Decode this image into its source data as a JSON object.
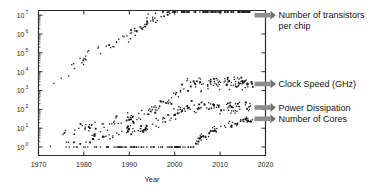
{
  "chart_data": {
    "type": "scatter",
    "title": "",
    "xlabel": "Year",
    "ylabel": "",
    "xlim": [
      1970,
      2020
    ],
    "ylim_log10": [
      0,
      7
    ],
    "yscale": "log",
    "grid": false,
    "legend_position": "right-inline-annotations",
    "xticks": [
      "1970",
      "1980",
      "1990",
      "2000",
      "2010",
      "2020"
    ],
    "xtick_values": [
      1970,
      1980,
      1990,
      2000,
      2010,
      2020
    ],
    "yticks": [
      "10^0",
      "10^1",
      "10^2",
      "10^3",
      "10^4",
      "10^5",
      "10^6",
      "10^7"
    ],
    "ytick_exponents": [
      0,
      1,
      2,
      3,
      4,
      5,
      6,
      7
    ],
    "annotations": [
      {
        "id": "transistors",
        "label_line1": "Number of transistors",
        "label_line2": "per chip",
        "y_log10": 7.0
      },
      {
        "id": "clock-speed",
        "label_line1": "Clock Speed (GHz)",
        "label_line2": "",
        "y_log10": 3.35
      },
      {
        "id": "power-dissipation",
        "label_line1": "Power Dissipation",
        "label_line2": "",
        "y_log10": 2.1
      },
      {
        "id": "cores",
        "label_line1": "Number of Cores",
        "label_line2": "",
        "y_log10": 1.5
      }
    ],
    "series": [
      {
        "name": "Number of transistors per chip",
        "color": "#1c1c1c",
        "points": [
          [
            1971,
            3.36
          ],
          [
            1972,
            3.4
          ],
          [
            1972,
            3.48
          ],
          [
            1974,
            3.65
          ],
          [
            1974,
            3.7
          ],
          [
            1976,
            3.85
          ],
          [
            1978,
            4.46
          ],
          [
            1979,
            4.46
          ],
          [
            1982,
            5.14
          ],
          [
            1985,
            5.44
          ],
          [
            1986,
            5.43
          ],
          [
            1988,
            5.6
          ],
          [
            1989,
            6.06
          ],
          [
            1989,
            5.93
          ],
          [
            1990,
            6.0
          ],
          [
            1991,
            6.13
          ],
          [
            1992,
            6.18
          ],
          [
            1992,
            6.3
          ],
          [
            1993,
            6.49
          ],
          [
            1993,
            6.54
          ],
          [
            1994,
            6.6
          ],
          [
            1994,
            6.72
          ],
          [
            1995,
            6.73
          ],
          [
            1995,
            6.81
          ],
          [
            1996,
            6.86
          ],
          [
            1996,
            6.95
          ],
          [
            1997,
            6.88
          ],
          [
            1997,
            7.0
          ],
          [
            1998,
            7.02
          ],
          [
            1998,
            7.11
          ],
          [
            1999,
            7.14
          ],
          [
            1999,
            7.27
          ],
          [
            2000,
            7.33
          ],
          [
            2000,
            7.45
          ],
          [
            2001,
            7.43
          ],
          [
            2001,
            7.55
          ],
          [
            2002,
            7.65
          ],
          [
            2002,
            7.78
          ],
          [
            2003,
            7.82
          ],
          [
            2003,
            7.92
          ],
          [
            2004,
            8.02
          ],
          [
            2004,
            8.13
          ],
          [
            2005,
            8.08
          ],
          [
            2005,
            8.2
          ],
          [
            2006,
            8.23
          ],
          [
            2006,
            8.38
          ],
          [
            2007,
            8.4
          ],
          [
            2007,
            8.52
          ],
          [
            2008,
            8.58
          ],
          [
            2008,
            8.7
          ],
          [
            2009,
            8.68
          ],
          [
            2009,
            8.83
          ],
          [
            2010,
            8.9
          ],
          [
            2010,
            9.04
          ],
          [
            2011,
            9.08
          ],
          [
            2011,
            9.22
          ],
          [
            2012,
            9.26
          ],
          [
            2012,
            9.4
          ],
          [
            2013,
            9.36
          ],
          [
            2013,
            9.52
          ],
          [
            2014,
            9.58
          ],
          [
            2014,
            9.7
          ],
          [
            2015,
            9.68
          ],
          [
            2016,
            9.82
          ],
          [
            2017,
            9.9
          ],
          [
            2017,
            10.0
          ]
        ]
      },
      {
        "name": "Clock Speed (GHz)",
        "color": "#1c1c1c",
        "points": [
          [
            1971,
            0.0
          ],
          [
            1974,
            0.3
          ],
          [
            1976,
            0.7
          ],
          [
            1979,
            1.0
          ],
          [
            1982,
            1.1
          ],
          [
            1985,
            1.2
          ],
          [
            1988,
            1.4
          ],
          [
            1990,
            1.5
          ],
          [
            1992,
            1.6
          ],
          [
            1993,
            1.8
          ],
          [
            1994,
            1.9
          ],
          [
            1995,
            2.0
          ],
          [
            1996,
            2.1
          ],
          [
            1997,
            2.2
          ],
          [
            1998,
            2.35
          ],
          [
            1999,
            2.5
          ],
          [
            2000,
            2.7
          ],
          [
            2001,
            2.9
          ],
          [
            2002,
            3.1
          ],
          [
            2003,
            3.3
          ],
          [
            2004,
            3.4
          ],
          [
            2005,
            3.4
          ],
          [
            2006,
            3.35
          ],
          [
            2007,
            3.35
          ],
          [
            2008,
            3.38
          ],
          [
            2009,
            3.35
          ],
          [
            2010,
            3.38
          ],
          [
            2011,
            3.4
          ],
          [
            2012,
            3.4
          ],
          [
            2013,
            3.42
          ],
          [
            2014,
            3.42
          ],
          [
            2015,
            3.42
          ],
          [
            2016,
            3.45
          ],
          [
            2017,
            3.45
          ]
        ]
      },
      {
        "name": "Power Dissipation",
        "color": "#1c1c1c",
        "points": [
          [
            1971,
            -0.2
          ],
          [
            1974,
            0.0
          ],
          [
            1979,
            0.3
          ],
          [
            1985,
            0.6
          ],
          [
            1990,
            0.8
          ],
          [
            1993,
            1.0
          ],
          [
            1995,
            1.2
          ],
          [
            1997,
            1.4
          ],
          [
            1999,
            1.6
          ],
          [
            2000,
            1.8
          ],
          [
            2001,
            1.9
          ],
          [
            2002,
            2.0
          ],
          [
            2003,
            2.05
          ],
          [
            2004,
            2.1
          ],
          [
            2005,
            2.1
          ],
          [
            2006,
            2.08
          ],
          [
            2007,
            2.1
          ],
          [
            2008,
            2.12
          ],
          [
            2009,
            2.1
          ],
          [
            2010,
            2.12
          ],
          [
            2011,
            2.12
          ],
          [
            2012,
            2.1
          ],
          [
            2013,
            2.12
          ],
          [
            2014,
            2.12
          ],
          [
            2015,
            2.12
          ],
          [
            2016,
            2.13
          ],
          [
            2017,
            2.13
          ]
        ]
      },
      {
        "name": "Number of Cores",
        "color": "#1c1c1c",
        "points": [
          [
            1971,
            0
          ],
          [
            1975,
            0
          ],
          [
            1980,
            0
          ],
          [
            1985,
            0
          ],
          [
            1990,
            0
          ],
          [
            1995,
            0
          ],
          [
            2000,
            0
          ],
          [
            2003,
            0
          ],
          [
            2004,
            0
          ],
          [
            2005,
            0.3
          ],
          [
            2006,
            0.6
          ],
          [
            2007,
            0.6
          ],
          [
            2008,
            0.9
          ],
          [
            2009,
            0.9
          ],
          [
            2010,
            1.0
          ],
          [
            2011,
            1.1
          ],
          [
            2012,
            1.2
          ],
          [
            2013,
            1.2
          ],
          [
            2014,
            1.3
          ],
          [
            2015,
            1.4
          ],
          [
            2016,
            1.45
          ],
          [
            2017,
            1.5
          ]
        ]
      }
    ]
  },
  "axes": {
    "x_title": "Year",
    "x_tick_labels": [
      "1970",
      "1980",
      "1990",
      "2000",
      "2010",
      "2020"
    ],
    "y_tick_bases": [
      "10",
      "10",
      "10",
      "10",
      "10",
      "10",
      "10",
      "10"
    ],
    "y_tick_exponents": [
      "0",
      "1",
      "2",
      "3",
      "4",
      "5",
      "6",
      "7"
    ]
  },
  "annotations": {
    "transistors": {
      "line1": "Number of transistors",
      "line2": "per chip"
    },
    "clock_speed": {
      "line1": "Clock Speed (GHz)"
    },
    "power_dissipation": {
      "line1": "Power Dissipation"
    },
    "cores": {
      "line1": "Number of Cores"
    }
  },
  "colors": {
    "marker": "#1c1c1c",
    "axis": "#2b2b2b",
    "arrow": "#8d8d8d",
    "background": "#ffffff"
  }
}
